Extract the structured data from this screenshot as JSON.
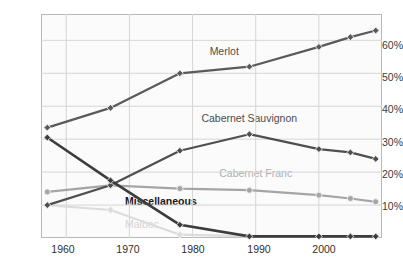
{
  "chart_data": {
    "type": "line",
    "title": "",
    "xlabel": "",
    "ylabel": "",
    "x": [
      1957,
      1967,
      1978,
      1989,
      2000,
      2005,
      2009
    ],
    "xlim": [
      1956,
      2010
    ],
    "ylim": [
      0,
      68
    ],
    "grid": true,
    "legend": "inline-labels",
    "y_ticks": [
      "10%",
      "20%",
      "30%",
      "40%",
      "50%",
      "60%"
    ],
    "y_tick_values": [
      10,
      20,
      30,
      40,
      50,
      60
    ],
    "x_ticks": [
      "1960",
      "1970",
      "1980",
      "1990",
      "2000"
    ],
    "x_tick_values": [
      1960,
      1970,
      1980,
      1990,
      2000
    ],
    "series": [
      {
        "name": "Merlot",
        "color": "#5a5a5a",
        "marker": "diamond",
        "values": [
          33.5,
          39.5,
          50.0,
          52.0,
          58.0,
          61.0,
          63.0
        ],
        "label_x": 1985,
        "label_y": 56.5
      },
      {
        "name": "Cabernet Sauvignon",
        "color": "#4f4f4f",
        "marker": "diamond",
        "values": [
          10.0,
          16.0,
          26.5,
          31.5,
          27.0,
          26.0,
          24.0
        ],
        "label_x": 1989,
        "label_y": 36.0
      },
      {
        "name": "Cabernet Franc",
        "color": "#a5a5a5",
        "marker": "circle",
        "values": [
          14.0,
          16.0,
          15.0,
          14.5,
          13.0,
          12.0,
          11.0
        ],
        "label_x": 1990,
        "label_y": 19.5
      },
      {
        "name": "Miscellaneous",
        "color": "#3c3c3c",
        "marker": "diamond",
        "values": [
          30.5,
          17.5,
          4.0,
          0.5,
          0.5,
          0.5,
          0.5
        ],
        "label_x": 1975,
        "label_y": 11.0
      },
      {
        "name": "Malbec",
        "color": "#dcdcdc",
        "marker": "diamond",
        "values": [
          10.0,
          8.5,
          1.0,
          0.5,
          0.5,
          0.5,
          0.5
        ],
        "label_x": 1972,
        "label_y": 4.0
      }
    ]
  },
  "axes": {
    "y_labels": [
      "60%",
      "50%",
      "40%",
      "30%",
      "20%",
      "10%"
    ],
    "x_labels": [
      "1960",
      "1970",
      "1980",
      "1990",
      "2000"
    ]
  },
  "colors": {
    "plot_background": "#fbfbfb",
    "frame": "#b9b9b9",
    "gridline": "#d6d6d6",
    "page_background": "#ffffff"
  }
}
